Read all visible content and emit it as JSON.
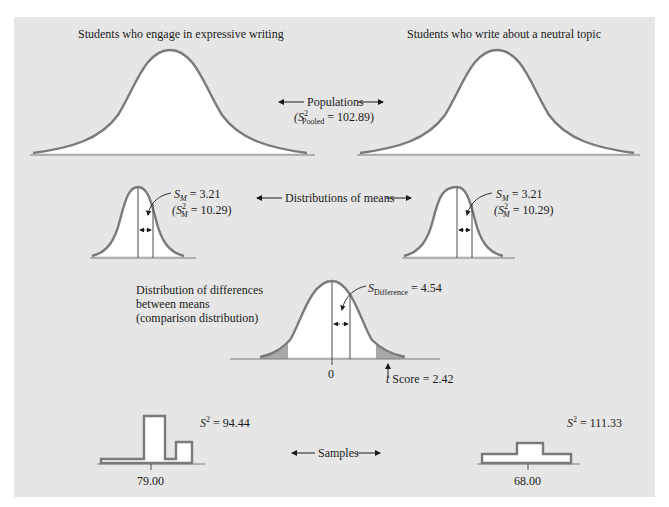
{
  "populations": {
    "left_title": "Students who engage in expressive writing",
    "right_title": "Students who write about a neutral topic",
    "center_label": "Populations",
    "pooled_var_prefix": "(S",
    "pooled_var_sup": "2",
    "pooled_var_sub": "Pooled",
    "pooled_var_value": " = 102.89)"
  },
  "distributions_of_means": {
    "center_label": "Distributions of means",
    "left": {
      "sm_symbol": "S",
      "sm_sub": "M",
      "sm_value": " = 3.21",
      "var_prefix": "(S",
      "var_sup": "2",
      "var_sub": "M",
      "var_value": " = 10.29)"
    },
    "right": {
      "sm_symbol": "S",
      "sm_sub": "M",
      "sm_value": " = 3.21",
      "var_prefix": "(S",
      "var_sup": "2",
      "var_sub": "M",
      "var_value": " = 10.29)"
    }
  },
  "comparison": {
    "title_line1": "Distribution of differences",
    "title_line2": "between means",
    "title_line3": "(comparison distribution)",
    "sdiff_symbol": "S",
    "sdiff_sub": "Difference",
    "sdiff_value": " = 4.54",
    "zero_label": "0",
    "t_symbol": "t",
    "t_label": " Score = 2.42"
  },
  "samples": {
    "center_label": "Samples",
    "left": {
      "var_symbol": "S",
      "var_sup": "2",
      "var_value": " = 94.44",
      "mean_label": "79.00"
    },
    "right": {
      "var_symbol": "S",
      "var_sup": "2",
      "var_value": " = 111.33",
      "mean_label": "68.00"
    }
  },
  "colors": {
    "panel_bg": "#e6e6e6",
    "curve_stroke": "#7a7a7a",
    "curve_fill": "#ffffff",
    "tail_fill": "#a8a8a8",
    "text": "#1a1a1a"
  }
}
